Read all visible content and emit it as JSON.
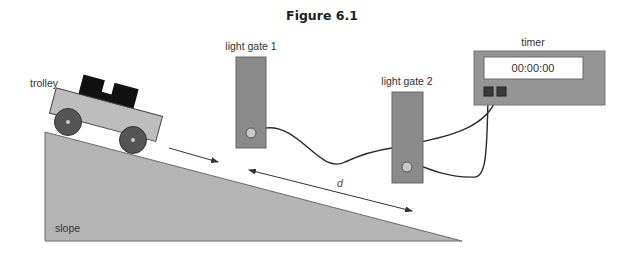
{
  "figure": {
    "title": "Figure 6.1",
    "labels": {
      "trolley": "trolley",
      "slope": "slope",
      "light_gate_1": "light gate 1",
      "light_gate_2": "light gate 2",
      "timer": "timer",
      "distance": "d"
    },
    "timer_display": "00:00:00",
    "colors": {
      "slope_fill": "#b4b4b4",
      "gate_fill": "#8a8a8a",
      "timer_fill": "#959595",
      "load_fill": "#111111",
      "trolley_body": "#bdbdbd",
      "wheel": "#555555",
      "wire": "#2a2a2a"
    }
  }
}
